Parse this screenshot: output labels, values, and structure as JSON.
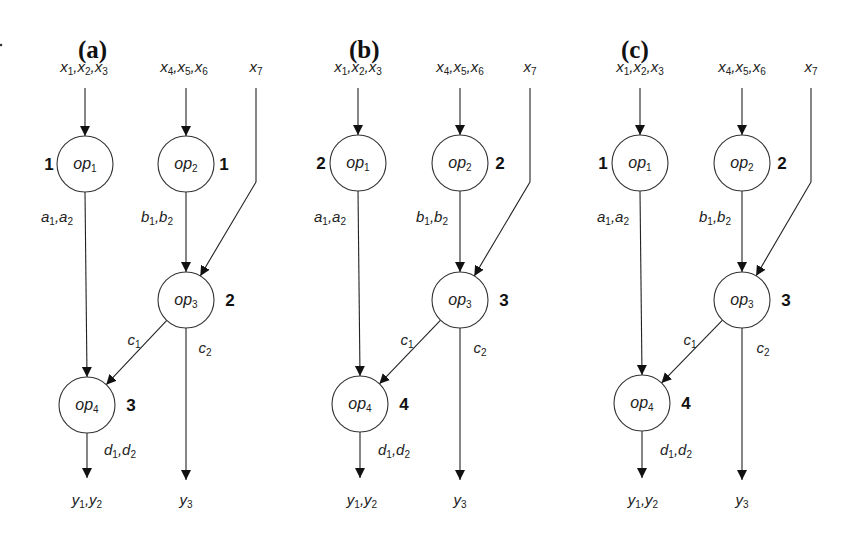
{
  "figure": {
    "stray_mark": {
      "x": 1,
      "y": 45
    },
    "node_radius": 28,
    "panels": [
      {
        "id": "a",
        "title": "(a)",
        "title_pos": [
          78,
          58
        ],
        "inputs": [
          {
            "text": [
              [
                "x",
                "1"
              ],
              [
                "x",
                "2"
              ],
              [
                "x",
                "3"
              ]
            ],
            "x": 84,
            "y": 72
          },
          {
            "text": [
              [
                "x",
                "4"
              ],
              [
                "x",
                "5"
              ],
              [
                "x",
                "6"
              ]
            ],
            "x": 184,
            "y": 72
          },
          {
            "text": [
              [
                "x",
                "7"
              ]
            ],
            "x": 256,
            "y": 72
          }
        ],
        "nodes": [
          {
            "id": "op1",
            "name": "op",
            "sub": "1",
            "cx": 85,
            "cy": 164,
            "order": "1",
            "order_pos": [
              -36,
              6
            ]
          },
          {
            "id": "op2",
            "name": "op",
            "sub": "2",
            "cx": 186,
            "cy": 164,
            "order": "1",
            "order_pos": [
              38,
              6
            ]
          },
          {
            "id": "op3",
            "name": "op",
            "sub": "3",
            "cx": 186,
            "cy": 300,
            "order": "2",
            "order_pos": [
              44,
              6
            ]
          },
          {
            "id": "op4",
            "name": "op",
            "sub": "4",
            "cx": 87,
            "cy": 405,
            "order": "3",
            "order_pos": [
              44,
              6
            ]
          }
        ],
        "x7_line": {
          "x": 256,
          "y_top": 88,
          "y_bend": 182
        },
        "edge_labels": [
          {
            "text": [
              [
                "a",
                "1"
              ],
              [
                "a",
                "2"
              ]
            ],
            "x": 57,
            "y": 222
          },
          {
            "text": [
              [
                "b",
                "1"
              ],
              [
                "b",
                "2"
              ]
            ],
            "x": 157,
            "y": 222
          },
          {
            "text": [
              [
                "c",
                "1"
              ]
            ],
            "x": 134,
            "y": 345
          },
          {
            "text": [
              [
                "c",
                "2"
              ]
            ],
            "x": 205,
            "y": 353
          },
          {
            "text": [
              [
                "d",
                "1"
              ],
              [
                "d",
                "2"
              ]
            ],
            "x": 120,
            "y": 455
          }
        ],
        "outputs": [
          {
            "text": [
              [
                "y",
                "1"
              ],
              [
                "y",
                "2"
              ]
            ],
            "x": 87,
            "y": 505
          },
          {
            "text": [
              [
                "y",
                "3"
              ]
            ],
            "x": 186,
            "y": 505
          }
        ]
      },
      {
        "id": "b",
        "title": "(b)",
        "title_pos": [
          349,
          58
        ],
        "inputs": [
          {
            "text": [
              [
                "x",
                "1"
              ],
              [
                "x",
                "2"
              ],
              [
                "x",
                "3"
              ]
            ],
            "x": 358,
            "y": 72
          },
          {
            "text": [
              [
                "x",
                "4"
              ],
              [
                "x",
                "5"
              ],
              [
                "x",
                "6"
              ]
            ],
            "x": 460,
            "y": 72
          },
          {
            "text": [
              [
                "x",
                "7"
              ]
            ],
            "x": 530,
            "y": 72
          }
        ],
        "nodes": [
          {
            "id": "op1",
            "name": "op",
            "sub": "1",
            "cx": 358,
            "cy": 163,
            "order": "2",
            "order_pos": [
              -37,
              6
            ]
          },
          {
            "id": "op2",
            "name": "op",
            "sub": "2",
            "cx": 460,
            "cy": 163,
            "order": "2",
            "order_pos": [
              40,
              6
            ]
          },
          {
            "id": "op3",
            "name": "op",
            "sub": "3",
            "cx": 460,
            "cy": 300,
            "order": "3",
            "order_pos": [
              44,
              6
            ]
          },
          {
            "id": "op4",
            "name": "op",
            "sub": "4",
            "cx": 360,
            "cy": 404,
            "order": "4",
            "order_pos": [
              44,
              6
            ]
          }
        ],
        "x7_line": {
          "x": 530,
          "y_top": 88,
          "y_bend": 182
        },
        "edge_labels": [
          {
            "text": [
              [
                "a",
                "1"
              ],
              [
                "a",
                "2"
              ]
            ],
            "x": 330,
            "y": 222
          },
          {
            "text": [
              [
                "b",
                "1"
              ],
              [
                "b",
                "2"
              ]
            ],
            "x": 432,
            "y": 222
          },
          {
            "text": [
              [
                "c",
                "1"
              ]
            ],
            "x": 407,
            "y": 345
          },
          {
            "text": [
              [
                "c",
                "2"
              ]
            ],
            "x": 480,
            "y": 353
          },
          {
            "text": [
              [
                "d",
                "1"
              ],
              [
                "d",
                "2"
              ]
            ],
            "x": 394,
            "y": 455
          }
        ],
        "outputs": [
          {
            "text": [
              [
                "y",
                "1"
              ],
              [
                "y",
                "2"
              ]
            ],
            "x": 362,
            "y": 505
          },
          {
            "text": [
              [
                "y",
                "3"
              ]
            ],
            "x": 460,
            "y": 505
          }
        ]
      },
      {
        "id": "c",
        "title": "(c)",
        "title_pos": [
          621,
          58
        ],
        "inputs": [
          {
            "text": [
              [
                "x",
                "1"
              ],
              [
                "x",
                "2"
              ],
              [
                "x",
                "3"
              ]
            ],
            "x": 640,
            "y": 72
          },
          {
            "text": [
              [
                "x",
                "4"
              ],
              [
                "x",
                "5"
              ],
              [
                "x",
                "6"
              ]
            ],
            "x": 742,
            "y": 72
          },
          {
            "text": [
              [
                "x",
                "7"
              ]
            ],
            "x": 811,
            "y": 72
          }
        ],
        "nodes": [
          {
            "id": "op1",
            "name": "op",
            "sub": "1",
            "cx": 640,
            "cy": 163,
            "order": "1",
            "order_pos": [
              -37,
              6
            ]
          },
          {
            "id": "op2",
            "name": "op",
            "sub": "2",
            "cx": 742,
            "cy": 163,
            "order": "2",
            "order_pos": [
              40,
              6
            ]
          },
          {
            "id": "op3",
            "name": "op",
            "sub": "3",
            "cx": 742,
            "cy": 300,
            "order": "3",
            "order_pos": [
              44,
              6
            ]
          },
          {
            "id": "op4",
            "name": "op",
            "sub": "4",
            "cx": 642,
            "cy": 403,
            "order": "4",
            "order_pos": [
              44,
              6
            ]
          }
        ],
        "x7_line": {
          "x": 811,
          "y_top": 88,
          "y_bend": 182
        },
        "edge_labels": [
          {
            "text": [
              [
                "a",
                "1"
              ],
              [
                "a",
                "2"
              ]
            ],
            "x": 613,
            "y": 222
          },
          {
            "text": [
              [
                "b",
                "1"
              ],
              [
                "b",
                "2"
              ]
            ],
            "x": 715,
            "y": 222
          },
          {
            "text": [
              [
                "c",
                "1"
              ]
            ],
            "x": 690,
            "y": 345
          },
          {
            "text": [
              [
                "c",
                "2"
              ]
            ],
            "x": 763,
            "y": 353
          },
          {
            "text": [
              [
                "d",
                "1"
              ],
              [
                "d",
                "2"
              ]
            ],
            "x": 676,
            "y": 455
          }
        ],
        "outputs": [
          {
            "text": [
              [
                "y",
                "1"
              ],
              [
                "y",
                "2"
              ]
            ],
            "x": 643,
            "y": 505
          },
          {
            "text": [
              [
                "y",
                "3"
              ]
            ],
            "x": 742,
            "y": 505
          }
        ]
      }
    ]
  }
}
